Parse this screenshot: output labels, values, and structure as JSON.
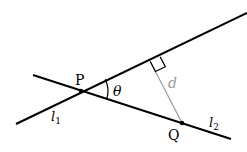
{
  "diagram": {
    "colors": {
      "line": "#000000",
      "perpendicular": "#9a9a9a",
      "d_label": "#9a9a9a",
      "background": "#ffffff"
    },
    "points": {
      "P": {
        "label": "P",
        "x": 81,
        "y": 91
      },
      "Q": {
        "label": "Q",
        "x": 182,
        "y": 123
      },
      "foot": {
        "x": 150,
        "y": 61
      }
    },
    "lines": {
      "l1": {
        "label": "l",
        "subscript": "1",
        "x1": 16,
        "y1": 124,
        "x2": 247,
        "y2": 13
      },
      "l2": {
        "label": "l",
        "subscript": "2",
        "x1": 33,
        "y1": 75,
        "x2": 231,
        "y2": 139
      }
    },
    "angle": {
      "label": "θ"
    },
    "distance": {
      "label": "d"
    }
  }
}
